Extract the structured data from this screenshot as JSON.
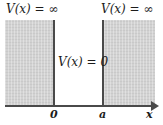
{
  "figure": {
    "barrier_left_label": "V(x) = ∞",
    "barrier_right_label": "V(x) = ∞",
    "well_label": "V(x) = 0",
    "tick_zero": "0",
    "tick_a": "a",
    "axis_label_x": "x",
    "colors": {
      "barrier_fill": "#d2d2d2",
      "wall_line": "#4a4a4a",
      "axis_line": "#4a4a4a",
      "text": "#1c1c1c",
      "background": "#ffffff"
    }
  },
  "chart_data": {
    "type": "line",
    "xlabel": "x",
    "ylabel": "V(x)",
    "x_ticks": [
      "0",
      "a"
    ],
    "x_tick_values": [
      0,
      1
    ],
    "regions": [
      {
        "name": "left-barrier",
        "x_range": [
          "-∞",
          0
        ],
        "value": "∞",
        "label": "V(x) = ∞",
        "shaded": true
      },
      {
        "name": "well",
        "x_range": [
          0,
          "a"
        ],
        "value": 0,
        "label": "V(x) = 0",
        "shaded": false
      },
      {
        "name": "right-barrier",
        "x_range": [
          "a",
          "∞"
        ],
        "value": "∞",
        "label": "V(x) = ∞",
        "shaded": true
      }
    ],
    "grid": false,
    "legend": "none"
  }
}
